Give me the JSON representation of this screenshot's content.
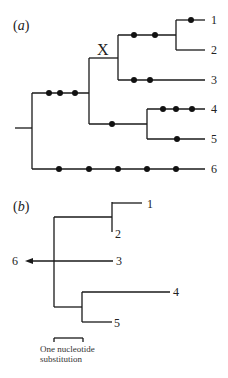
{
  "panels": {
    "a": {
      "label_open": "(",
      "label_letter": "a",
      "label_close": ")",
      "node_marker": "X",
      "tips": [
        "1",
        "2",
        "3",
        "4",
        "5",
        "6"
      ],
      "dot_counts": {
        "root_to_upper_clade": 3,
        "upper_clade_to_node_X_child_12": 2,
        "to_tip_1": 1,
        "to_tip_2": 0,
        "to_tip_3": 2,
        "upper_clade_to_clade_45": 1,
        "to_tip_4": 3,
        "to_tip_5": 1,
        "to_tip_6": 5
      }
    },
    "b": {
      "label_open": "(",
      "label_letter": "b",
      "label_close": ")",
      "tips": [
        "1",
        "2",
        "3",
        "4",
        "5",
        "6"
      ],
      "scale_bar": {
        "line1": "One nucleotide",
        "line2": "substitution"
      }
    }
  },
  "colors": {
    "line": "#1a1a1a",
    "dot": "#111111",
    "background": "#ffffff"
  }
}
